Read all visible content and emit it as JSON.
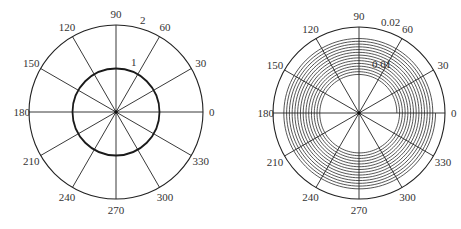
{
  "chart_data": [
    {
      "type": "polar",
      "angle_ticks": [
        "0",
        "30",
        "60",
        "90",
        "120",
        "150",
        "180",
        "210",
        "240",
        "270",
        "300",
        "330"
      ],
      "radial_ticks": [
        "1",
        "2"
      ],
      "rlim": [
        0,
        2
      ],
      "series": [
        {
          "name": "circle",
          "r": 1.0,
          "theta_range": [
            0,
            360
          ]
        }
      ],
      "grid": true
    },
    {
      "type": "polar",
      "angle_ticks": [
        "0",
        "30",
        "60",
        "90",
        "120",
        "150",
        "180",
        "210",
        "240",
        "270",
        "300",
        "330"
      ],
      "radial_ticks": [
        "0.01",
        "0.02"
      ],
      "rlim": [
        0,
        0.02
      ],
      "series": [
        {
          "name": "spiral",
          "r_start": 0.0088,
          "r_end": 0.0178,
          "turns": 14
        }
      ],
      "grid": true
    }
  ],
  "plots": [
    {
      "cx": 116,
      "cy": 112,
      "R": 87,
      "rmax": 2,
      "radial_labels": [
        {
          "text": "1",
          "r": 1,
          "dx": 6,
          "dy": -7
        },
        {
          "text": "2",
          "r": 2,
          "dx": 6,
          "dy": -7
        }
      ],
      "angle_labels": [
        "0",
        "30",
        "60",
        "90",
        "120",
        "150",
        "180",
        "210",
        "240",
        "270",
        "300",
        "330"
      ]
    },
    {
      "cx": 359,
      "cy": 113,
      "R": 86,
      "rmax": 0.02,
      "radial_labels": [
        {
          "text": "0.01",
          "r": 0.01,
          "dx": 4,
          "dy": -7
        },
        {
          "text": "0.02",
          "r": 0.02,
          "dx": 4,
          "dy": -7
        }
      ],
      "angle_labels": [
        "0",
        "30",
        "60",
        "90",
        "120",
        "150",
        "180",
        "210",
        "240",
        "270",
        "300",
        "330"
      ]
    }
  ]
}
